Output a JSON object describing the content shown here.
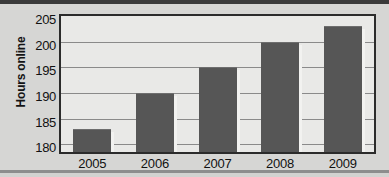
{
  "chart_data": {
    "type": "bar",
    "title": "",
    "xlabel": "",
    "ylabel": "Hours online",
    "categories": [
      "2005",
      "2006",
      "2007",
      "2008",
      "2009"
    ],
    "values": [
      183,
      190,
      195,
      200,
      203
    ],
    "series": [
      {
        "name": "Hours online",
        "values": [
          183,
          190,
          195,
          200,
          203
        ]
      }
    ],
    "yticks": [
      180,
      185,
      190,
      195,
      200,
      205
    ],
    "ylim": [
      178.5,
      205
    ],
    "xlim_categories": 5,
    "grid": true,
    "grid_axis": "y",
    "legend": false,
    "legend_position": "none",
    "bar_color": "#565656",
    "plot_background": "#e9e9e7",
    "frame_color": "#2b2b2b",
    "gridline_color": "#8a8a8a",
    "page_background": "#d6d6d4",
    "text_color": "#111111"
  }
}
